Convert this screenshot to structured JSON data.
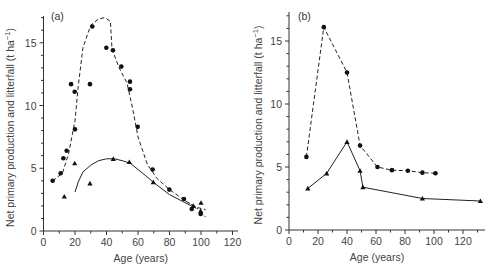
{
  "chart_data": [
    {
      "panel": "(a)",
      "type": "scatter",
      "xlabel": "Age (years)",
      "ylabel": "Net primary production and litterfall (t ha⁻¹)",
      "xlim": [
        0,
        120
      ],
      "ylim": [
        0,
        17.5
      ],
      "xticks": [
        0,
        20,
        40,
        60,
        80,
        100,
        120
      ],
      "yticks": [
        0,
        5,
        10,
        15
      ],
      "grid": false,
      "series": [
        {
          "name": "Net primary production",
          "marker": "circle",
          "points": [
            [
              5.8,
              4.0
            ],
            [
              10.9,
              4.6
            ],
            [
              12.6,
              5.8
            ],
            [
              14.7,
              6.4
            ],
            [
              17.5,
              11.7
            ],
            [
              19.8,
              11.1
            ],
            [
              20,
              8.1
            ],
            [
              29.5,
              11.7
            ],
            [
              31,
              16.3
            ],
            [
              39.9,
              14.6
            ],
            [
              44.1,
              14.4
            ],
            [
              49.4,
              13.1
            ],
            [
              54.9,
              11.9
            ],
            [
              54.9,
              11.3
            ],
            [
              59.8,
              8.3
            ],
            [
              69.3,
              4.9
            ],
            [
              79.9,
              3.3
            ],
            [
              89.2,
              2.55
            ],
            [
              94.1,
              1.75
            ],
            [
              99.8,
              1.35
            ]
          ],
          "fit_line": "dashed",
          "fit": [
            [
              5.8,
              4.0
            ],
            [
              12,
              4.6
            ],
            [
              16,
              6.2
            ],
            [
              20,
              8.8
            ],
            [
              22,
              11.5
            ],
            [
              25,
              14.6
            ],
            [
              30,
              16.4
            ],
            [
              35,
              16.9
            ],
            [
              39,
              17.0
            ],
            [
              42.5,
              16.7
            ],
            [
              43.5,
              14.5
            ],
            [
              48,
              13.0
            ],
            [
              53,
              11.8
            ],
            [
              57,
              9.5
            ],
            [
              60,
              7.5
            ],
            [
              66,
              5.3
            ],
            [
              72,
              4.2
            ],
            [
              80,
              3.3
            ],
            [
              90,
              2.4
            ],
            [
              97,
              1.9
            ],
            [
              103,
              1.7
            ]
          ]
        },
        {
          "name": "Litterfall",
          "marker": "triangle",
          "points": [
            [
              13.2,
              2.75
            ],
            [
              19.8,
              5.4
            ],
            [
              29.5,
              3.8
            ],
            [
              44.3,
              5.75
            ],
            [
              54.5,
              5.5
            ],
            [
              69.7,
              3.9
            ],
            [
              95.1,
              2.0
            ],
            [
              100,
              2.25
            ],
            [
              99.8,
              1.6
            ]
          ],
          "fit_line": "solid",
          "fit": [
            [
              20,
              3.1
            ],
            [
              22,
              3.9
            ],
            [
              25,
              4.7
            ],
            [
              30,
              5.25
            ],
            [
              35,
              5.6
            ],
            [
              40,
              5.75
            ],
            [
              45,
              5.75
            ],
            [
              50,
              5.6
            ],
            [
              55,
              5.4
            ],
            [
              60,
              4.9
            ],
            [
              65,
              4.4
            ],
            [
              70,
              3.85
            ],
            [
              80,
              2.9
            ],
            [
              90,
              2.25
            ],
            [
              97,
              1.8
            ]
          ],
          "fit_dotted_tail": [
            [
              90,
              2.4
            ],
            [
              97,
              1.9
            ],
            [
              103,
              1.1
            ]
          ]
        }
      ]
    },
    {
      "panel": "(b)",
      "type": "line",
      "xlabel": "Age (years)",
      "ylabel": "Net primary production and litterfall (t ha⁻¹)",
      "xlim": [
        0,
        135
      ],
      "ylim": [
        0,
        17.5
      ],
      "xticks": [
        0,
        20,
        40,
        60,
        80,
        100,
        120
      ],
      "yticks": [
        0,
        5,
        10,
        15
      ],
      "grid": false,
      "series": [
        {
          "name": "Net primary production",
          "marker": "circle",
          "line": "dashed",
          "points": [
            [
              12,
              5.8
            ],
            [
              24,
              16.1
            ],
            [
              40,
              12.5
            ],
            [
              49,
              6.7
            ],
            [
              61,
              5.0
            ],
            [
              71,
              4.75
            ],
            [
              82,
              4.7
            ],
            [
              92,
              4.55
            ],
            [
              101,
              4.5
            ]
          ]
        },
        {
          "name": "Litterfall",
          "marker": "triangle",
          "line": "solid",
          "points": [
            [
              13,
              3.3
            ],
            [
              26,
              4.5
            ],
            [
              40,
              7.0
            ],
            [
              49,
              4.7
            ],
            [
              51,
              3.4
            ],
            [
              92,
              2.5
            ],
            [
              132,
              2.3
            ]
          ]
        }
      ]
    }
  ],
  "labels": {
    "panel_a": "(a)",
    "panel_b": "(b)",
    "xlabel": "Age (years)",
    "ylabel_main": "Net primary production and litterfall (t ha",
    "ylabel_sup": "−1",
    "ylabel_close": ")"
  }
}
